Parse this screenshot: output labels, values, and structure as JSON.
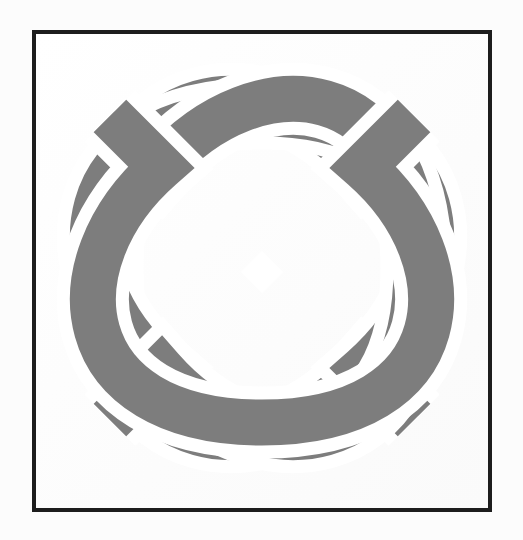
{
  "document": {
    "type": "scanned-figure",
    "page_background": "#fcfcfc",
    "paper_color": "#ffffff"
  },
  "frame": {
    "name": "figure-border",
    "x": 32,
    "y": 30,
    "width": 460,
    "height": 482,
    "border_color": "#1d1d1d",
    "border_width": 4,
    "fill": "#ffffff"
  },
  "figure": {
    "title": "Endless Knot",
    "symbol_name": "endless-knot",
    "ink_color": "#7d7d7d",
    "gap_color": "#ffffff",
    "center_x": 262,
    "center_y": 268,
    "bounding_box": {
      "left": 47,
      "top": 54,
      "right": 478,
      "bottom": 482
    },
    "band_width": 46,
    "gap_width": 13,
    "lobe_count": 4,
    "center_diamond": {
      "cx": 262,
      "cy": 272,
      "half_width": 21
    },
    "lobes": [
      {
        "name": "top-lobe",
        "angle": -90,
        "tip_x": 262,
        "tip_y": 54
      },
      {
        "name": "right-lobe",
        "angle": 0,
        "tip_x": 478,
        "tip_y": 268
      },
      {
        "name": "bottom-lobe",
        "angle": 90,
        "tip_x": 262,
        "tip_y": 482
      },
      {
        "name": "left-lobe",
        "angle": 180,
        "tip_x": 47,
        "tip_y": 268
      }
    ]
  },
  "chart_data": {
    "type": "table",
    "columns": [
      "element",
      "value"
    ],
    "rows": [
      [
        "lobes",
        "4"
      ],
      [
        "band width (px)",
        "46"
      ],
      [
        "center diamond half-width (px)",
        "21"
      ],
      [
        "ink color",
        "#7d7d7d"
      ]
    ]
  }
}
